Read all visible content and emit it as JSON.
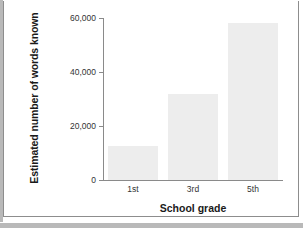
{
  "chart_data": {
    "type": "bar",
    "title": "",
    "subtitle": "",
    "xlabel": "School grade",
    "ylabel": "Estimated number of words known",
    "categories": [
      "1st",
      "3rd",
      "5th"
    ],
    "values": [
      12500,
      32000,
      58000
    ],
    "series": [
      {
        "name": "Estimated number of words known",
        "values": [
          12500,
          32000,
          58000
        ]
      }
    ],
    "ylim": [
      0,
      60000
    ],
    "yticks": [
      0,
      20000,
      40000,
      60000
    ],
    "ytick_labels": [
      "0",
      "20,000",
      "40,000",
      "60,000"
    ],
    "grid": false,
    "legend": false,
    "legend_position": "none",
    "bar_color": "#ededed",
    "axis_color": "#8a8a8a",
    "text_color": "#1a1a1a"
  },
  "figure": {
    "border_color": "#8d8d8d",
    "shadow_color": "#b9b9b9",
    "background": "#ffffff"
  }
}
